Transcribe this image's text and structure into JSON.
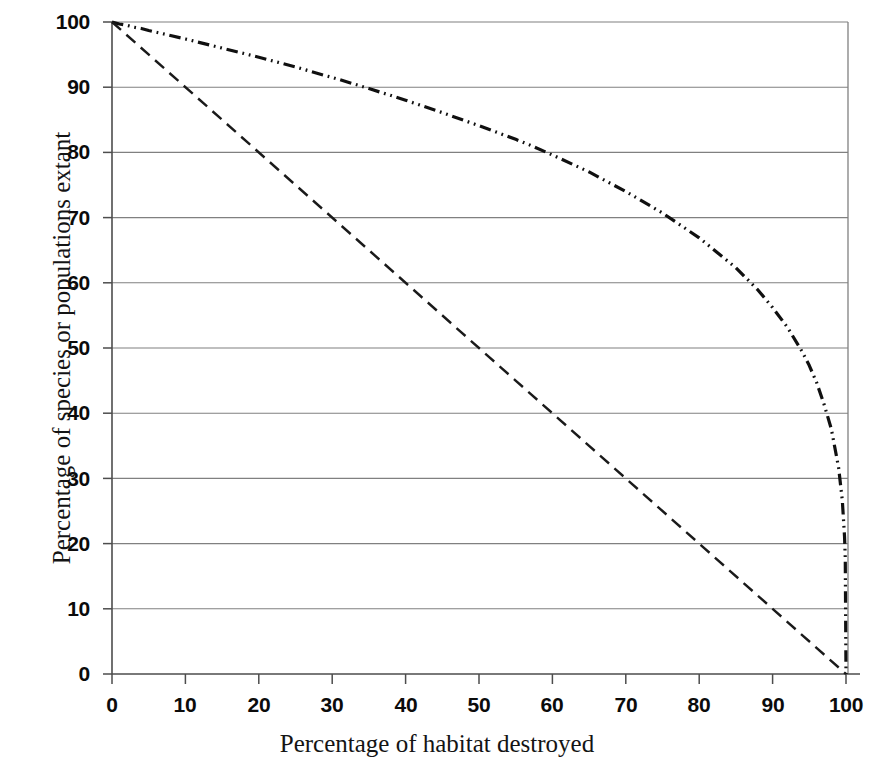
{
  "chart_data": {
    "type": "line",
    "title": "",
    "xlabel": "Percentage of habitat destroyed",
    "ylabel": "Percentage of species or populations extant",
    "xlim": [
      0,
      100
    ],
    "ylim": [
      0,
      100
    ],
    "xticks": [
      0,
      10,
      20,
      30,
      40,
      50,
      60,
      70,
      80,
      90,
      100
    ],
    "yticks": [
      0,
      10,
      20,
      30,
      40,
      50,
      60,
      70,
      80,
      90,
      100
    ],
    "xtick_labels": [
      "0",
      "10",
      "20",
      "30",
      "40",
      "50",
      "60",
      "70",
      "80",
      "90",
      "100"
    ],
    "ytick_labels": [
      "0",
      "10",
      "20",
      "30",
      "40",
      "50",
      "60",
      "70",
      "80",
      "90",
      "100"
    ],
    "grid": "horizontal",
    "grid_color": "#7a7a7a",
    "legend": "none",
    "background": "#ffffff",
    "axis_color": "#4d4d4d",
    "series": [
      {
        "name": "Species-area relationship curve",
        "style": "dash-dot",
        "color": "#101010",
        "linewidth": 3.2,
        "x": [
          0,
          1,
          2,
          3,
          4,
          5,
          10,
          15,
          20,
          25,
          29,
          30,
          35,
          40,
          45,
          50,
          55,
          57,
          60,
          65,
          70,
          75,
          80,
          85,
          88,
          90,
          92,
          94,
          95,
          96,
          97,
          98,
          99,
          99.5,
          99.8,
          99.9,
          100
        ],
        "y": [
          100,
          99.7,
          99.5,
          99.2,
          99.0,
          98.7,
          97.4,
          96.0,
          94.6,
          93.1,
          91.8,
          91.5,
          89.8,
          88.0,
          86.1,
          84.1,
          82.0,
          81.1,
          79.6,
          77.0,
          74.0,
          70.7,
          66.9,
          62.3,
          58.9,
          56.2,
          53.2,
          49.5,
          47.3,
          44.7,
          41.4,
          37.6,
          31.6,
          26.6,
          21.1,
          17.8,
          0
        ]
      },
      {
        "name": "Proportional (one-to-one) loss line",
        "style": "dashed",
        "color": "#1a1a1a",
        "linewidth": 2.4,
        "x": [
          0,
          100
        ],
        "y": [
          100,
          0
        ]
      }
    ],
    "annotations": []
  },
  "axis": {
    "x_title": "Percentage of habitat destroyed",
    "y_title": "Percentage of species or populations extant"
  },
  "icons": {
    "chart_area": "line-chart-icon"
  }
}
